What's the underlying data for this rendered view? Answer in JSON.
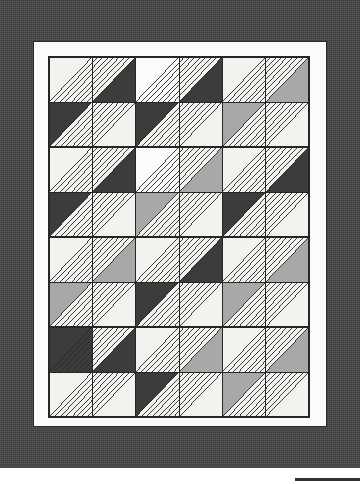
{
  "figure": {
    "kind": "quilt-pattern-diagram",
    "title": "",
    "caption": ""
  },
  "palette": {
    "outer_border": "#3f3f3f",
    "inner_border": "#fbfbfb",
    "page_background": "#ffffff",
    "fabric_light": "#f2f2ee",
    "fabric_white": "#fbfbfa",
    "fabric_medium": "#a8a8a8",
    "fabric_dark": "#3c3c3c",
    "stitch_line": "#2a2a2a",
    "seam_line": "#262626"
  },
  "layout": {
    "outer_border_width": 360,
    "outer_border_height": 468,
    "inner_border_x": 33,
    "inner_border_y": 41,
    "inner_border_width": 294,
    "inner_border_height": 386,
    "quilt_x": 48,
    "quilt_y": 56,
    "quilt_width": 262,
    "quilt_height": 362,
    "grid_columns": 6,
    "grid_rows": 8,
    "cell_width": 43.6,
    "cell_height": 45.2,
    "block_columns": 3,
    "block_rows": 4,
    "stitch_lines_per_triangle": 7
  },
  "chart_data": {
    "type": "heatmap",
    "xlabel": "column",
    "ylabel": "row",
    "categories": [
      "c1",
      "c2",
      "c3",
      "c4",
      "c5",
      "c6"
    ],
    "legend": [
      "light",
      "white",
      "medium",
      "dark"
    ],
    "note": "Each grid cell is a square split on a diagonal into two triangles. Values list the two triangle fabrics per cell as [upper/left, lower/right] plus the diagonal orientation and which half carries the nested stitch quilting.",
    "cells": [
      [
        {
          "diag": "tlbr",
          "a": "light",
          "b": "light",
          "quilt": "b",
          "fan": "none"
        },
        {
          "diag": "tlbr",
          "a": "light",
          "b": "dark",
          "quilt": "a",
          "fan": "tl"
        },
        {
          "diag": "tlbr",
          "a": "white",
          "b": "white",
          "quilt": "b",
          "fan": "none"
        },
        {
          "diag": "tlbr",
          "a": "light",
          "b": "dark",
          "quilt": "a",
          "fan": "tl"
        },
        {
          "diag": "tlbr",
          "a": "light",
          "b": "light",
          "quilt": "b",
          "fan": "none"
        },
        {
          "diag": "tlbr",
          "a": "light",
          "b": "medium",
          "quilt": "a",
          "fan": "tl"
        }
      ],
      [
        {
          "diag": "tlbr",
          "a": "dark",
          "b": "light",
          "quilt": "b",
          "fan": "br"
        },
        {
          "diag": "tlbr",
          "a": "light",
          "b": "light",
          "quilt": "a",
          "fan": "none"
        },
        {
          "diag": "tlbr",
          "a": "dark",
          "b": "light",
          "quilt": "b",
          "fan": "br"
        },
        {
          "diag": "tlbr",
          "a": "light",
          "b": "light",
          "quilt": "a",
          "fan": "none"
        },
        {
          "diag": "tlbr",
          "a": "medium",
          "b": "light",
          "quilt": "b",
          "fan": "br"
        },
        {
          "diag": "tlbr",
          "a": "light",
          "b": "light",
          "quilt": "a",
          "fan": "none"
        }
      ],
      [
        {
          "diag": "tlbr",
          "a": "light",
          "b": "light",
          "quilt": "b",
          "fan": "none"
        },
        {
          "diag": "tlbr",
          "a": "light",
          "b": "dark",
          "quilt": "a",
          "fan": "tl"
        },
        {
          "diag": "tlbr",
          "a": "white",
          "b": "white",
          "quilt": "b",
          "fan": "none"
        },
        {
          "diag": "tlbr",
          "a": "light",
          "b": "medium",
          "quilt": "a",
          "fan": "tl"
        },
        {
          "diag": "tlbr",
          "a": "light",
          "b": "light",
          "quilt": "b",
          "fan": "none"
        },
        {
          "diag": "tlbr",
          "a": "light",
          "b": "dark",
          "quilt": "a",
          "fan": "tl"
        }
      ],
      [
        {
          "diag": "tlbr",
          "a": "dark",
          "b": "light",
          "quilt": "b",
          "fan": "br"
        },
        {
          "diag": "tlbr",
          "a": "light",
          "b": "light",
          "quilt": "a",
          "fan": "none"
        },
        {
          "diag": "tlbr",
          "a": "medium",
          "b": "light",
          "quilt": "b",
          "fan": "br"
        },
        {
          "diag": "tlbr",
          "a": "light",
          "b": "light",
          "quilt": "a",
          "fan": "none"
        },
        {
          "diag": "tlbr",
          "a": "dark",
          "b": "light",
          "quilt": "b",
          "fan": "br"
        },
        {
          "diag": "tlbr",
          "a": "light",
          "b": "light",
          "quilt": "a",
          "fan": "none"
        }
      ],
      [
        {
          "diag": "tlbr",
          "a": "light",
          "b": "light",
          "quilt": "b",
          "fan": "none"
        },
        {
          "diag": "tlbr",
          "a": "light",
          "b": "medium",
          "quilt": "a",
          "fan": "tl"
        },
        {
          "diag": "tlbr",
          "a": "light",
          "b": "light",
          "quilt": "b",
          "fan": "none"
        },
        {
          "diag": "tlbr",
          "a": "light",
          "b": "dark",
          "quilt": "a",
          "fan": "tl"
        },
        {
          "diag": "tlbr",
          "a": "light",
          "b": "light",
          "quilt": "b",
          "fan": "none"
        },
        {
          "diag": "tlbr",
          "a": "light",
          "b": "medium",
          "quilt": "a",
          "fan": "tl"
        }
      ],
      [
        {
          "diag": "tlbr",
          "a": "medium",
          "b": "light",
          "quilt": "b",
          "fan": "br"
        },
        {
          "diag": "tlbr",
          "a": "light",
          "b": "light",
          "quilt": "a",
          "fan": "none"
        },
        {
          "diag": "tlbr",
          "a": "dark",
          "b": "light",
          "quilt": "b",
          "fan": "br"
        },
        {
          "diag": "tlbr",
          "a": "light",
          "b": "light",
          "quilt": "a",
          "fan": "none"
        },
        {
          "diag": "tlbr",
          "a": "medium",
          "b": "light",
          "quilt": "b",
          "fan": "br"
        },
        {
          "diag": "tlbr",
          "a": "light",
          "b": "light",
          "quilt": "a",
          "fan": "none"
        }
      ],
      [
        {
          "diag": "tlbr",
          "a": "dark",
          "b": "dark",
          "quilt": "b",
          "fan": "none"
        },
        {
          "diag": "tlbr",
          "a": "light",
          "b": "dark",
          "quilt": "a",
          "fan": "tl"
        },
        {
          "diag": "tlbr",
          "a": "light",
          "b": "light",
          "quilt": "b",
          "fan": "none"
        },
        {
          "diag": "tlbr",
          "a": "light",
          "b": "medium",
          "quilt": "a",
          "fan": "tl"
        },
        {
          "diag": "tlbr",
          "a": "light",
          "b": "light",
          "quilt": "b",
          "fan": "none"
        },
        {
          "diag": "tlbr",
          "a": "light",
          "b": "medium",
          "quilt": "a",
          "fan": "tl"
        }
      ],
      [
        {
          "diag": "tlbr",
          "a": "light",
          "b": "light",
          "quilt": "b",
          "fan": "br"
        },
        {
          "diag": "tlbr",
          "a": "light",
          "b": "light",
          "quilt": "a",
          "fan": "none"
        },
        {
          "diag": "tlbr",
          "a": "dark",
          "b": "light",
          "quilt": "b",
          "fan": "br"
        },
        {
          "diag": "tlbr",
          "a": "light",
          "b": "light",
          "quilt": "a",
          "fan": "none"
        },
        {
          "diag": "tlbr",
          "a": "medium",
          "b": "light",
          "quilt": "b",
          "fan": "br"
        },
        {
          "diag": "tlbr",
          "a": "light",
          "b": "light",
          "quilt": "a",
          "fan": "none"
        }
      ]
    ]
  }
}
